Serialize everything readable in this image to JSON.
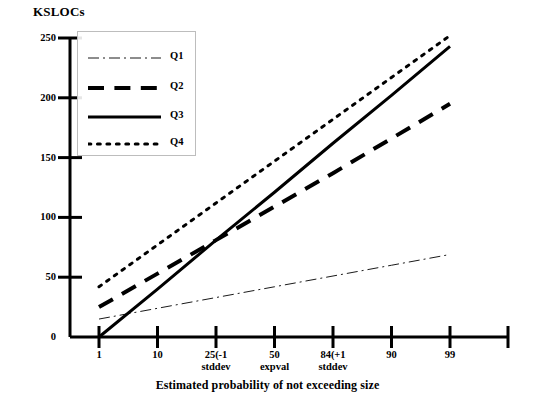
{
  "chart_data": {
    "type": "line",
    "title": "",
    "ylabel": "KSLOCs",
    "xlabel": "Estimated probability of not exceeding size",
    "grid": false,
    "legend_position": "top-left-inside",
    "ylim": [
      0,
      250
    ],
    "yticks": [
      0,
      50,
      100,
      150,
      200,
      250
    ],
    "ytick_labels": [
      "0",
      "50",
      "100",
      "150",
      "200",
      "250"
    ],
    "categories": [
      "1",
      "10",
      "25",
      "50",
      "84",
      "90",
      "99"
    ],
    "xtick_labels": [
      {
        "line1": "1",
        "line2": ""
      },
      {
        "line1": "10",
        "line2": ""
      },
      {
        "line1": "25(-1",
        "line2": "stddev"
      },
      {
        "line1": "50",
        "line2": "expval"
      },
      {
        "line1": "84(+1",
        "line2": "stddev"
      },
      {
        "line1": "90",
        "line2": ""
      },
      {
        "line1": "99",
        "line2": ""
      }
    ],
    "series": [
      {
        "name": "Q1",
        "style": "dashdot",
        "width": 1,
        "color": "#1a1a1a",
        "values": [
          15,
          24,
          33,
          42,
          51,
          60,
          69
        ]
      },
      {
        "name": "Q2",
        "style": "dashed",
        "width": 4,
        "color": "#000000",
        "values": [
          25,
          53,
          81,
          109,
          137,
          166,
          195
        ]
      },
      {
        "name": "Q3",
        "style": "solid",
        "width": 3,
        "color": "#000000",
        "values": [
          0,
          40,
          81,
          121,
          162,
          202,
          243
        ]
      },
      {
        "name": "Q4",
        "style": "dotted",
        "width": 3,
        "color": "#000000",
        "values": [
          42,
          77,
          112,
          147,
          182,
          217,
          252
        ]
      }
    ]
  },
  "legend": {
    "items": [
      {
        "label": "Q1"
      },
      {
        "label": "Q2"
      },
      {
        "label": "Q3"
      },
      {
        "label": "Q4"
      }
    ]
  }
}
